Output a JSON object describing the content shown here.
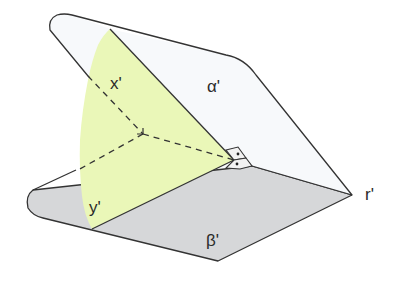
{
  "diagram": {
    "labels": {
      "x": "x'",
      "y": "y'",
      "alpha": "α'",
      "beta": "β'",
      "r": "r'"
    },
    "colors": {
      "outline": "#333333",
      "alpha_fill": "#f7f9fb",
      "beta_fill": "#d6d7d9",
      "cutting_plane_fill": "#eaf7b8",
      "cutting_plane_fill_over_beta": "#e2f0a8",
      "right_angle_box": "#f2f2f2"
    }
  }
}
